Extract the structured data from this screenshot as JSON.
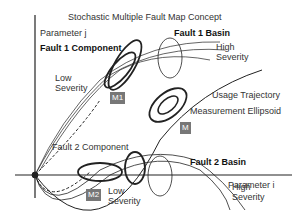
{
  "title": "Stochastic Multiple Fault Map Concept",
  "axes": {
    "y_label": "Parameter j",
    "x_label": "Parameter i"
  },
  "labels": {
    "fault1_component": "Fault 1 Component",
    "fault1_basin": "Fault 1 Basin",
    "fault1_high": "High",
    "fault1_high2": "Severity",
    "fault1_low": "Low",
    "fault1_low2": "Severity",
    "usage": "Usage Trajectory",
    "measurement": "Measurement Ellipsoid",
    "fault2_component": "Fault 2 Component",
    "fault2_basin": "Fault 2 Basin",
    "fault2_high": "High",
    "fault2_high2": "Severity",
    "fault2_low": "Low",
    "fault2_low2": "Severity"
  },
  "boxes": {
    "m1": "M1",
    "m": "M",
    "m2": "M2"
  }
}
